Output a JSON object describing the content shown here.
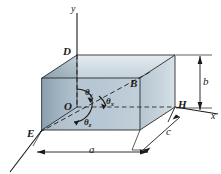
{
  "figure": {
    "type": "3d-box-direction-angles-diagram",
    "background_color": "#ffffff",
    "line_color": "#1a1a1a"
  },
  "axes": {
    "y_label": "y",
    "x_label": "x",
    "z_label": ""
  },
  "points": {
    "origin_label": "O",
    "top_label": "D",
    "right_interior_label": "B",
    "left_bottom_label": "E",
    "right_label": "H"
  },
  "angles": {
    "theta_y": {
      "symbol": "θ",
      "subscript": "y"
    },
    "theta_x": {
      "symbol": "θ",
      "subscript": "x"
    },
    "theta_z": {
      "symbol": "θ",
      "subscript": "z"
    }
  },
  "dimensions": {
    "width_label": "a",
    "height_label": "b",
    "depth_label": "c"
  },
  "colors": {
    "face_top": "#d4dee6",
    "face_front": "#b9c8d3",
    "face_left": "#8ba0ae",
    "face_right": "#c6d3dc",
    "outline": "#2b2b2b"
  }
}
